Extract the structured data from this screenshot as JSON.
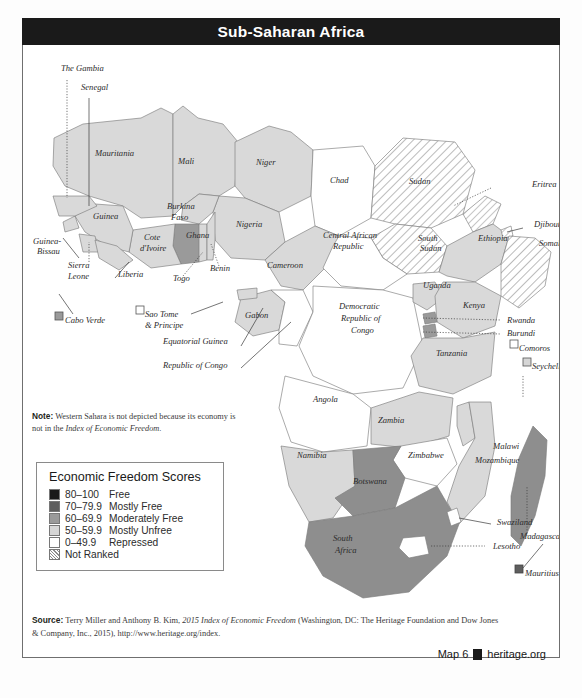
{
  "title": "Sub-Saharan Africa",
  "note": {
    "label": "Note:",
    "text": " Western Sahara is not depicted because its economy is not in the ",
    "italic": "Index of Economic Freedom",
    "tail": "."
  },
  "legend": {
    "heading": "Economic Freedom Scores",
    "items": [
      {
        "range": "80–100",
        "name": "Free",
        "color": "#1a1a1a",
        "pattern": "solid"
      },
      {
        "range": "70–79.9",
        "name": "Mostly Free",
        "color": "#5e5e5e",
        "pattern": "solid"
      },
      {
        "range": "60–69.9",
        "name": "Moderately Free",
        "color": "#9a9a9a",
        "pattern": "solid"
      },
      {
        "range": "50–59.9",
        "name": "Mostly Unfree",
        "color": "#d6d6d6",
        "pattern": "solid"
      },
      {
        "range": "0–49.9",
        "name": "Repressed",
        "color": "#ffffff",
        "pattern": "solid"
      },
      {
        "range": "",
        "name": "Not Ranked",
        "color": "#ffffff",
        "pattern": "hatch"
      }
    ]
  },
  "source": {
    "label": "Source:",
    "text": " Terry Miller and Anthony B. Kim, ",
    "italic": "2015 Index of Economic Freedom",
    "tail": " (Washington, DC: The Heritage Foundation and Dow Jones & Company, Inc., 2015), http://www.heritage.org/index."
  },
  "footer": {
    "map_number": "Map 6",
    "site": "heritage.org",
    "logo": "heritage-logo-icon"
  },
  "map": {
    "labels": [
      {
        "name": "The Gambia",
        "x": 38,
        "y": 25
      },
      {
        "name": "Senegal",
        "x": 58,
        "y": 44
      },
      {
        "name": "Mauritania",
        "x": 72,
        "y": 110
      },
      {
        "name": "Mali",
        "x": 155,
        "y": 118
      },
      {
        "name": "Niger",
        "x": 233,
        "y": 119
      },
      {
        "name": "Chad",
        "x": 307,
        "y": 137
      },
      {
        "name": "Sudan",
        "x": 386,
        "y": 138
      },
      {
        "name": "Eritrea",
        "x": 509,
        "y": 141
      },
      {
        "name": "Djibouti",
        "x": 511,
        "y": 181
      },
      {
        "name": "Somalia",
        "x": 516,
        "y": 200
      },
      {
        "name": "Ethiopia",
        "x": 455,
        "y": 195
      },
      {
        "name": "South",
        "x": 395,
        "y": 195
      },
      {
        "name": "Sudan",
        "x": 397,
        "y": 205
      },
      {
        "name": "Central African",
        "x": 300,
        "y": 192
      },
      {
        "name": "Republic",
        "x": 310,
        "y": 203
      },
      {
        "name": "Nigeria",
        "x": 213,
        "y": 181
      },
      {
        "name": "Burkina",
        "x": 144,
        "y": 163
      },
      {
        "name": "Faso",
        "x": 148,
        "y": 174
      },
      {
        "name": "Ghana",
        "x": 163,
        "y": 192
      },
      {
        "name": "Cote",
        "x": 121,
        "y": 194
      },
      {
        "name": "d'Ivoire",
        "x": 117,
        "y": 205
      },
      {
        "name": "Guinea",
        "x": 70,
        "y": 173
      },
      {
        "name": "Guinea-",
        "x": 10,
        "y": 198
      },
      {
        "name": "Bissau",
        "x": 14,
        "y": 208
      },
      {
        "name": "Sierra",
        "x": 45,
        "y": 222
      },
      {
        "name": "Leone",
        "x": 45,
        "y": 233
      },
      {
        "name": "Liberia",
        "x": 95,
        "y": 231
      },
      {
        "name": "Togo",
        "x": 150,
        "y": 235
      },
      {
        "name": "Benin",
        "x": 187,
        "y": 225
      },
      {
        "name": "Cameroon",
        "x": 244,
        "y": 222
      },
      {
        "name": "Cabo Verde",
        "x": 42,
        "y": 277
      },
      {
        "name": "Sao Tome",
        "x": 122,
        "y": 271
      },
      {
        "name": "& Principe",
        "x": 122,
        "y": 282
      },
      {
        "name": "Gabon",
        "x": 222,
        "y": 272
      },
      {
        "name": "Equatorial Guinea",
        "x": 140,
        "y": 298
      },
      {
        "name": "Republic of Congo",
        "x": 140,
        "y": 322
      },
      {
        "name": "Democratic",
        "x": 316,
        "y": 263
      },
      {
        "name": "Republic of",
        "x": 318,
        "y": 275
      },
      {
        "name": "Congo",
        "x": 328,
        "y": 287
      },
      {
        "name": "Uganda",
        "x": 400,
        "y": 242
      },
      {
        "name": "Kenya",
        "x": 440,
        "y": 262
      },
      {
        "name": "Rwanda",
        "x": 484,
        "y": 277
      },
      {
        "name": "Burundi",
        "x": 484,
        "y": 290
      },
      {
        "name": "Comoros",
        "x": 496,
        "y": 305
      },
      {
        "name": "Seychelles",
        "x": 509,
        "y": 323
      },
      {
        "name": "Tanzania",
        "x": 413,
        "y": 310
      },
      {
        "name": "Angola",
        "x": 290,
        "y": 356
      },
      {
        "name": "Zambia",
        "x": 355,
        "y": 377
      },
      {
        "name": "Malawi",
        "x": 470,
        "y": 403
      },
      {
        "name": "Mozambique",
        "x": 452,
        "y": 417
      },
      {
        "name": "Zimbabwe",
        "x": 385,
        "y": 412
      },
      {
        "name": "Namibia",
        "x": 274,
        "y": 412
      },
      {
        "name": "Botswana",
        "x": 330,
        "y": 438
      },
      {
        "name": "South",
        "x": 310,
        "y": 495
      },
      {
        "name": "Africa",
        "x": 312,
        "y": 507
      },
      {
        "name": "Swaziland",
        "x": 474,
        "y": 479
      },
      {
        "name": "Lesotho",
        "x": 470,
        "y": 503
      },
      {
        "name": "Madagascar",
        "x": 497,
        "y": 493
      },
      {
        "name": "Mauritius",
        "x": 502,
        "y": 530
      }
    ],
    "island_markers": [
      {
        "name": "Cabo Verde",
        "x": 32,
        "y": 272,
        "fill": "#9a9a9a"
      },
      {
        "name": "Sao Tome",
        "x": 113,
        "y": 266,
        "fill": "#ffffff"
      },
      {
        "name": "Comoros",
        "x": 487,
        "y": 300,
        "fill": "#ffffff"
      },
      {
        "name": "Seychelles",
        "x": 500,
        "y": 318,
        "fill": "#d6d6d6"
      },
      {
        "name": "Mauritius",
        "x": 492,
        "y": 525,
        "fill": "#5e5e5e"
      }
    ]
  }
}
